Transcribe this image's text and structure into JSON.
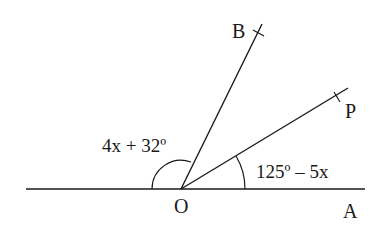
{
  "figure": {
    "type": "angle-diagram",
    "vertex": {
      "label": "O",
      "x": 181,
      "y": 189
    },
    "points": [
      {
        "label": "A",
        "x": 365,
        "y": 189
      },
      {
        "label": "B",
        "x": 257,
        "y": 24
      },
      {
        "label": "P",
        "x": 348,
        "y": 88
      }
    ],
    "lines": [
      {
        "name": "straight-line-through-O",
        "from": [
          26,
          189
        ],
        "to": [
          365,
          189
        ]
      },
      {
        "name": "ray-OB",
        "from": [
          181,
          189
        ],
        "to": [
          262,
          24
        ]
      },
      {
        "name": "ray-OP",
        "from": [
          181,
          189
        ],
        "to": [
          348,
          88
        ]
      }
    ],
    "angles": [
      {
        "name": "angle-left-to-OB",
        "expression": "4x + 32º"
      },
      {
        "name": "angle-AOP",
        "expression": "125º – 5x"
      }
    ]
  },
  "labels": {
    "O": "O",
    "A": "A",
    "B": "B",
    "P": "P",
    "angle_left": "4x + 32º",
    "angle_right": "125º – 5x"
  },
  "colors": {
    "ink": "#1a1a1a",
    "background": "#ffffff"
  }
}
